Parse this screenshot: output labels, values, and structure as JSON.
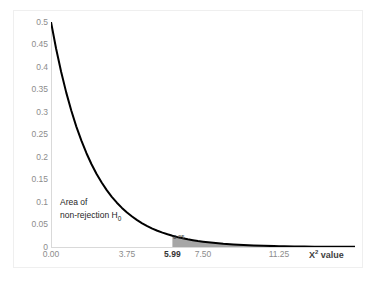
{
  "chart_data": {
    "type": "area",
    "title": "",
    "subtitle": "",
    "xlabel": "X² value",
    "ylabel": "",
    "xlim": [
      0,
      15
    ],
    "ylim": [
      0,
      0.5
    ],
    "grid": false,
    "legend": "none",
    "distribution": "chi-square density, df = 2: f(x) = 0.5 * e^(-x/2)",
    "x_ticks": [
      {
        "value": 0.0,
        "label": "0.00",
        "emphasis": false
      },
      {
        "value": 3.75,
        "label": "3.75",
        "emphasis": false
      },
      {
        "value": 5.99,
        "label": "5.99",
        "emphasis": true
      },
      {
        "value": 7.5,
        "label": "7.50",
        "emphasis": false
      },
      {
        "value": 11.25,
        "label": "11.25",
        "emphasis": false
      }
    ],
    "y_ticks": [
      {
        "value": 0.5,
        "label": "0.5"
      },
      {
        "value": 0.45,
        "label": "0.45"
      },
      {
        "value": 0.4,
        "label": "0.4"
      },
      {
        "value": 0.35,
        "label": "0.35"
      },
      {
        "value": 0.3,
        "label": "0.3"
      },
      {
        "value": 0.25,
        "label": "0.25"
      },
      {
        "value": 0.2,
        "label": "0.2"
      },
      {
        "value": 0.15,
        "label": "0.15"
      },
      {
        "value": 0.1,
        "label": "0.1"
      },
      {
        "value": 0.05,
        "label": "0.05"
      },
      {
        "value": 0.0,
        "label": "0"
      }
    ],
    "x": [
      0,
      0.25,
      0.5,
      0.75,
      1,
      1.25,
      1.5,
      1.75,
      2,
      2.25,
      2.5,
      2.75,
      3,
      3.25,
      3.5,
      3.75,
      4,
      4.25,
      4.5,
      4.75,
      5,
      5.25,
      5.5,
      5.75,
      5.99,
      6.25,
      6.5,
      6.75,
      7,
      7.25,
      7.5,
      7.75,
      8,
      8.5,
      9,
      9.5,
      10,
      10.5,
      11,
      11.25,
      11.5,
      12,
      12.5,
      13,
      13.5,
      14,
      14.5,
      15
    ],
    "values": [
      0.5,
      0.4412,
      0.3894,
      0.3436,
      0.3033,
      0.2676,
      0.2362,
      0.2084,
      0.1839,
      0.1623,
      0.1433,
      0.1264,
      0.1116,
      0.0985,
      0.0869,
      0.0767,
      0.0677,
      0.0597,
      0.0527,
      0.0465,
      0.041,
      0.0362,
      0.032,
      0.0282,
      0.025,
      0.022,
      0.0194,
      0.0171,
      0.0151,
      0.0133,
      0.0118,
      0.0104,
      0.0092,
      0.0071,
      0.0056,
      0.0043,
      0.0034,
      0.0026,
      0.002,
      0.0018,
      0.0016,
      0.0012,
      0.001,
      0.0008,
      0.0006,
      0.0005,
      0.0004,
      0.0003
    ],
    "series": [
      {
        "name": "chi-square density (df=2)",
        "color": "#000000",
        "line_width": 2
      }
    ],
    "shaded_regions": [
      {
        "name": "rejection-region",
        "from": 5.99,
        "to": 15,
        "color": "#a6a6a6",
        "label": "0.05"
      }
    ],
    "annotations": [
      {
        "name": "non-rejection-area",
        "line1": "Area of",
        "line2_prefix": "non-rejection H",
        "line2_sub": "0",
        "x": 1.0,
        "y": 0.095
      },
      {
        "name": "alpha-label",
        "text": "0.05",
        "x": 6.3,
        "y": 0.012
      }
    ]
  },
  "axis_title": {
    "main": "X",
    "sup": "2",
    "suffix": " value"
  },
  "colors": {
    "curve": "#000000",
    "axis_line": "#d9d9d9",
    "tick_text": "#8c8c8c",
    "tick_text_emphasis": "#333333",
    "annotation_text": "#262626",
    "shade": "#a6a6a6",
    "frame_border": "#efefef",
    "background": "#ffffff"
  }
}
